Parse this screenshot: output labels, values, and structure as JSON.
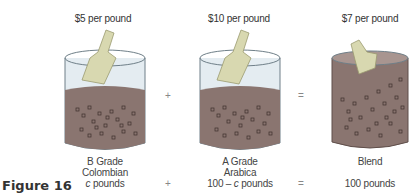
{
  "figure_label": "Figure 16",
  "items": [
    {
      "price": "$5 per pound",
      "line1": "B Grade",
      "line2": "Colombian",
      "qty_var": "c",
      "qty_rest": " pounds"
    },
    {
      "price": "$10 per pound",
      "line1": "A Grade",
      "line2": "Arabica",
      "qty_pre": "100 – ",
      "qty_var": "c",
      "qty_rest": " pounds"
    },
    {
      "price": "$7 per pound",
      "line1": "Blend",
      "qty_text": "100 pounds"
    }
  ],
  "operators": {
    "plus_top": "+",
    "equals_top": "=",
    "plus_bottom": "+",
    "equals_bottom": "="
  },
  "colors": {
    "coffee": "#8a7570",
    "glass": "#dfe8ee",
    "scoop": "#d8d8b0",
    "bean_outline": "#3d302c"
  }
}
